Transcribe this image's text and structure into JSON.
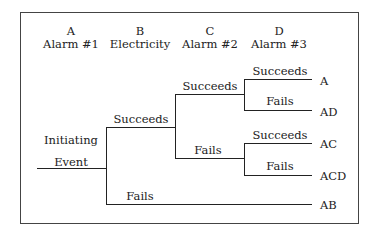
{
  "columns": [
    {
      "letter": "A",
      "label": "Alarm #1"
    },
    {
      "letter": "B",
      "label": "Electricity"
    },
    {
      "letter": "C",
      "label": "Alarm #2"
    },
    {
      "letter": "D",
      "label": "Alarm #3"
    }
  ],
  "initiating_event": {
    "line1": "Initiating",
    "line2": "Event"
  },
  "branches": {
    "b_succeeds": "Succeeds",
    "b_fails": "Fails",
    "c_succeeds": "Succeeds",
    "c_fails": "Fails",
    "d1_succeeds": "Succeeds",
    "d1_fails": "Fails",
    "d2_succeeds": "Succeeds",
    "d2_fails": "Fails"
  },
  "outcomes": [
    "A",
    "AD",
    "AC",
    "ACD",
    "AB"
  ]
}
